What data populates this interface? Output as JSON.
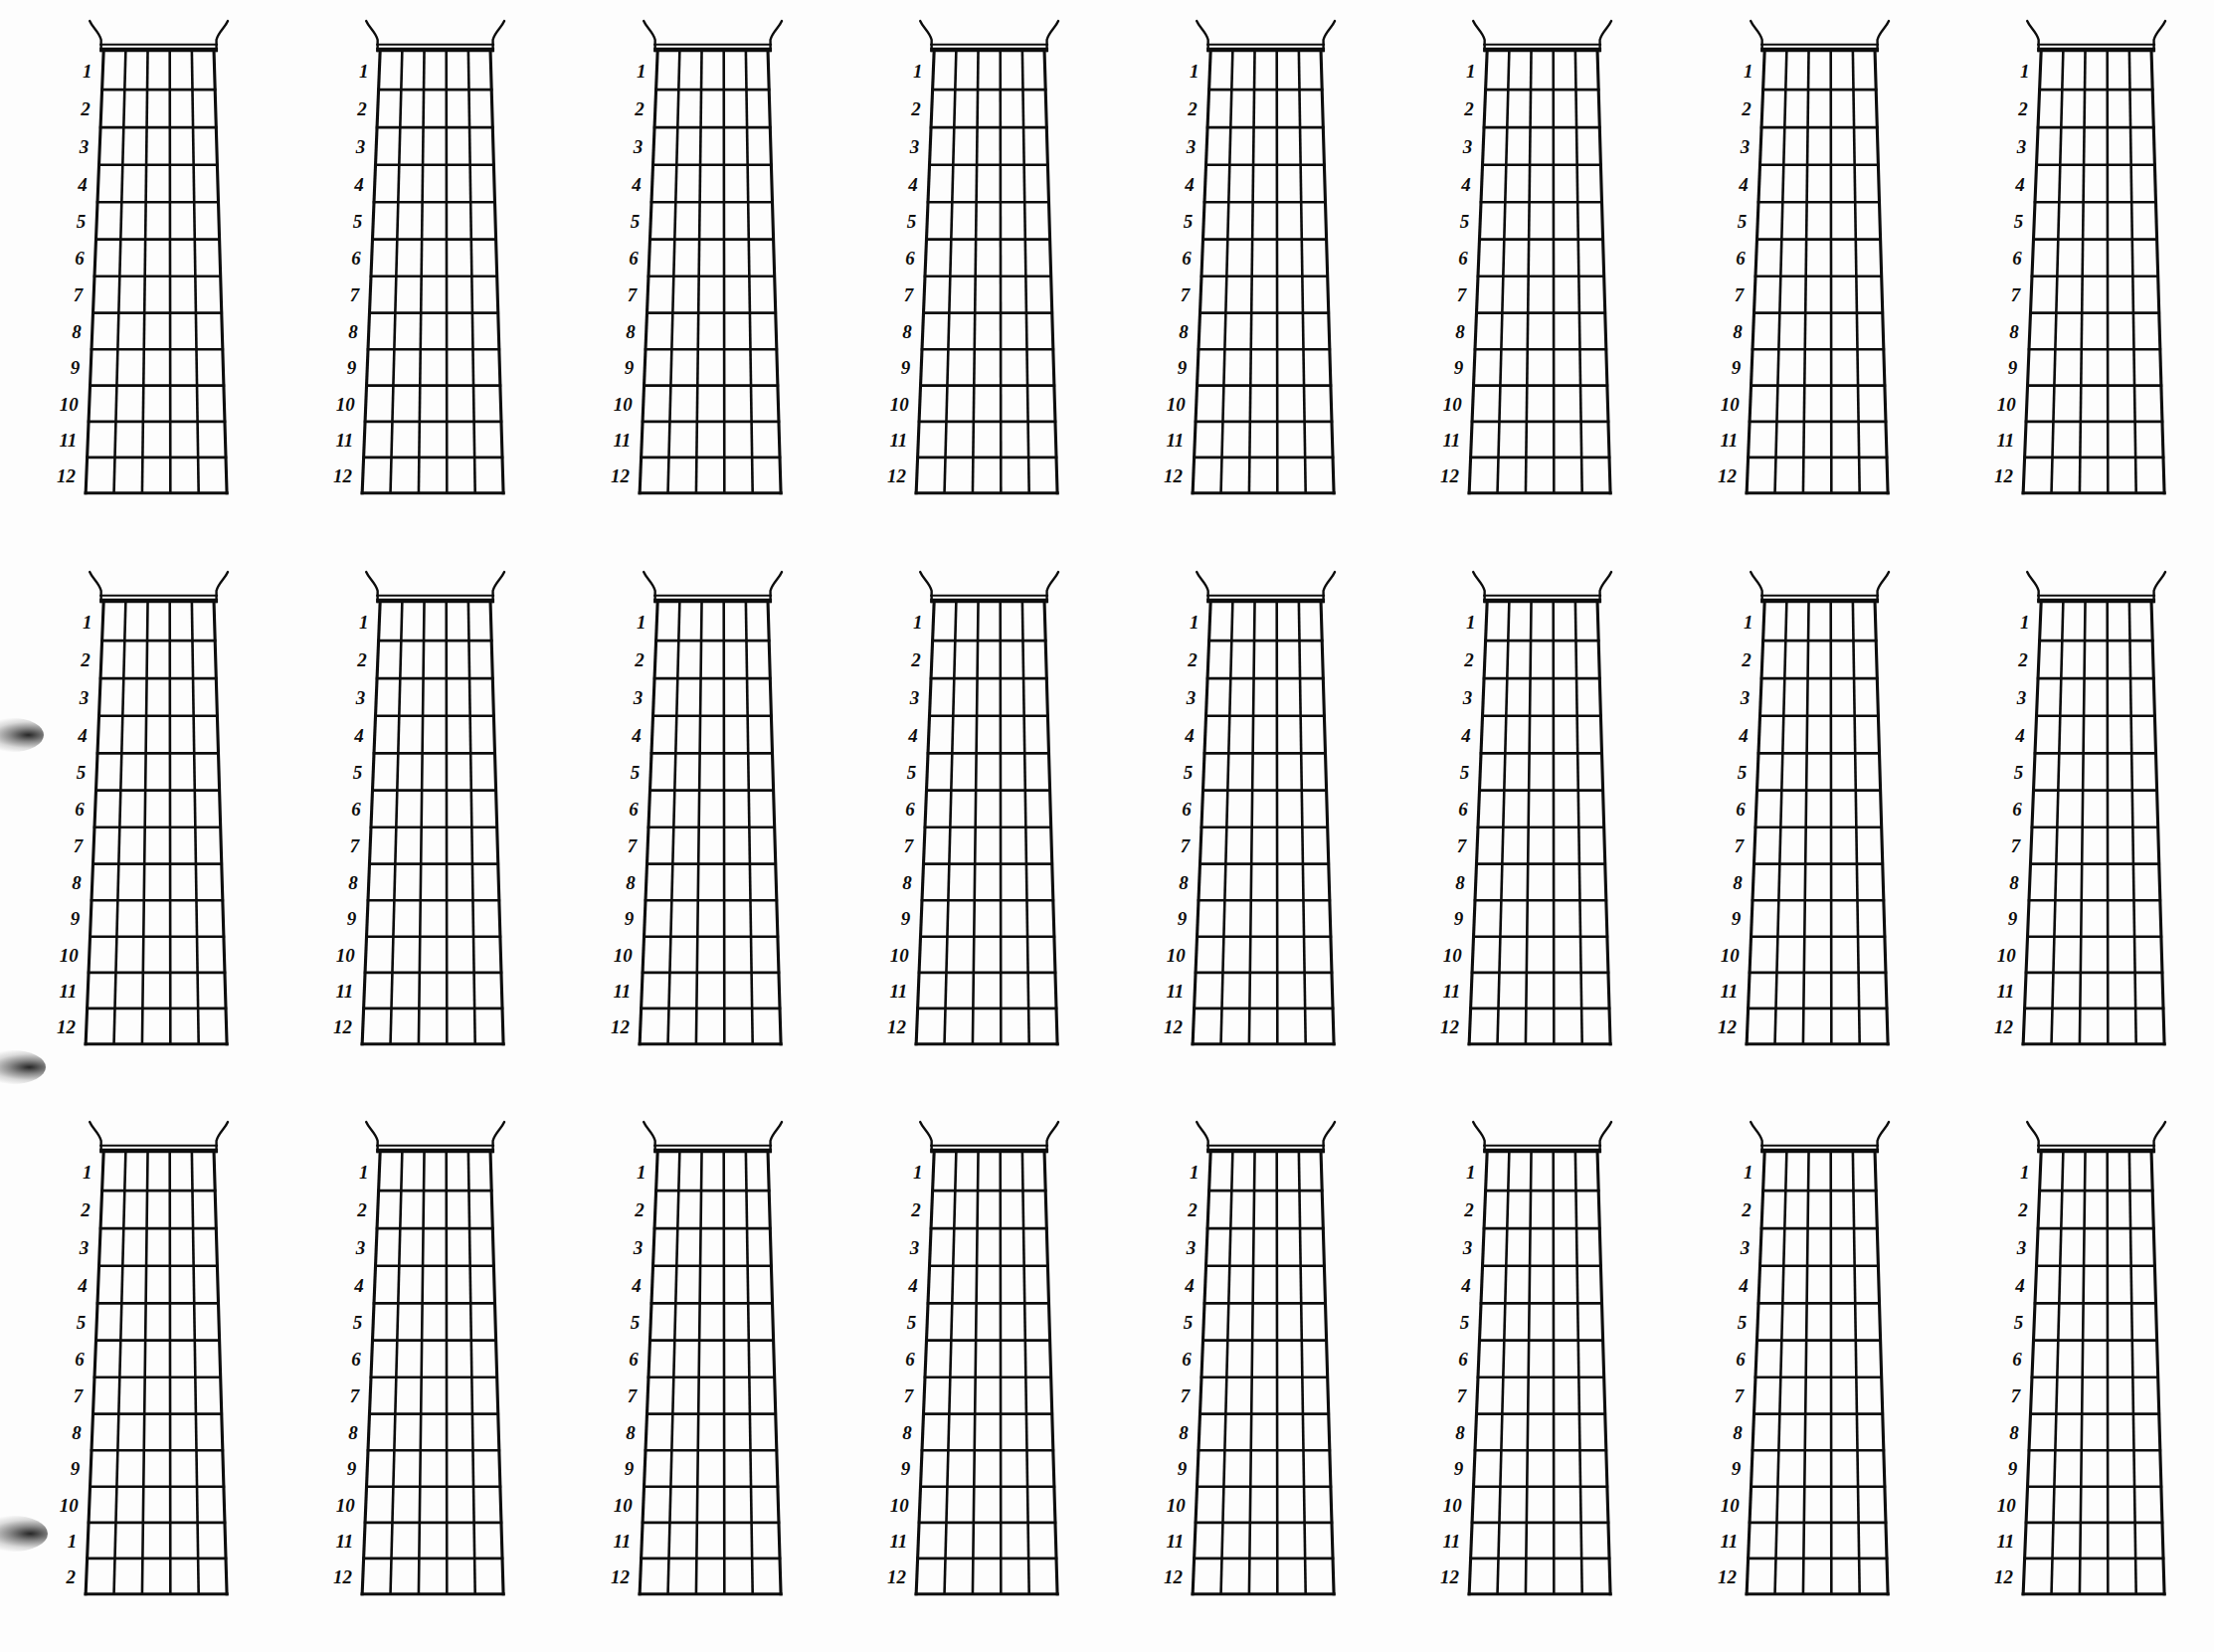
{
  "page": {
    "background_color": "#fdfdfd",
    "ink_color": "#0d0d0d",
    "rows": 3,
    "columns": 8,
    "diagram_count": 24
  },
  "diagram": {
    "instrument": "guitar",
    "string_count": 6,
    "fret_count": 12,
    "nut_label": "nut",
    "fret_numbers": [
      "1",
      "2",
      "3",
      "4",
      "5",
      "6",
      "7",
      "8",
      "9",
      "10",
      "11",
      "12"
    ]
  },
  "diagrams": [
    {
      "id": "diagram-r1c1",
      "row": 1,
      "col": 1,
      "fret_numbers": [
        "1",
        "2",
        "3",
        "4",
        "5",
        "6",
        "7",
        "8",
        "9",
        "10",
        "11",
        "12"
      ]
    },
    {
      "id": "diagram-r1c2",
      "row": 1,
      "col": 2,
      "fret_numbers": [
        "1",
        "2",
        "3",
        "4",
        "5",
        "6",
        "7",
        "8",
        "9",
        "10",
        "11",
        "12"
      ]
    },
    {
      "id": "diagram-r1c3",
      "row": 1,
      "col": 3,
      "fret_numbers": [
        "1",
        "2",
        "3",
        "4",
        "5",
        "6",
        "7",
        "8",
        "9",
        "10",
        "11",
        "12"
      ]
    },
    {
      "id": "diagram-r1c4",
      "row": 1,
      "col": 4,
      "fret_numbers": [
        "1",
        "2",
        "3",
        "4",
        "5",
        "6",
        "7",
        "8",
        "9",
        "10",
        "11",
        "12"
      ]
    },
    {
      "id": "diagram-r1c5",
      "row": 1,
      "col": 5,
      "fret_numbers": [
        "1",
        "2",
        "3",
        "4",
        "5",
        "6",
        "7",
        "8",
        "9",
        "10",
        "11",
        "12"
      ]
    },
    {
      "id": "diagram-r1c6",
      "row": 1,
      "col": 6,
      "fret_numbers": [
        "1",
        "2",
        "3",
        "4",
        "5",
        "6",
        "7",
        "8",
        "9",
        "10",
        "11",
        "12"
      ]
    },
    {
      "id": "diagram-r1c7",
      "row": 1,
      "col": 7,
      "fret_numbers": [
        "1",
        "2",
        "3",
        "4",
        "5",
        "6",
        "7",
        "8",
        "9",
        "10",
        "11",
        "12"
      ]
    },
    {
      "id": "diagram-r1c8",
      "row": 1,
      "col": 8,
      "fret_numbers": [
        "1",
        "2",
        "3",
        "4",
        "5",
        "6",
        "7",
        "8",
        "9",
        "10",
        "11",
        "12"
      ]
    },
    {
      "id": "diagram-r2c1",
      "row": 2,
      "col": 1,
      "fret_numbers": [
        "1",
        "2",
        "3",
        "4",
        "5",
        "6",
        "7",
        "8",
        "9",
        "10",
        "11",
        "12"
      ]
    },
    {
      "id": "diagram-r2c2",
      "row": 2,
      "col": 2,
      "fret_numbers": [
        "1",
        "2",
        "3",
        "4",
        "5",
        "6",
        "7",
        "8",
        "9",
        "10",
        "11",
        "12"
      ]
    },
    {
      "id": "diagram-r2c3",
      "row": 2,
      "col": 3,
      "fret_numbers": [
        "1",
        "2",
        "3",
        "4",
        "5",
        "6",
        "7",
        "8",
        "9",
        "10",
        "11",
        "12"
      ]
    },
    {
      "id": "diagram-r2c4",
      "row": 2,
      "col": 4,
      "fret_numbers": [
        "1",
        "2",
        "3",
        "4",
        "5",
        "6",
        "7",
        "8",
        "9",
        "10",
        "11",
        "12"
      ]
    },
    {
      "id": "diagram-r2c5",
      "row": 2,
      "col": 5,
      "fret_numbers": [
        "1",
        "2",
        "3",
        "4",
        "5",
        "6",
        "7",
        "8",
        "9",
        "10",
        "11",
        "12"
      ]
    },
    {
      "id": "diagram-r2c6",
      "row": 2,
      "col": 6,
      "fret_numbers": [
        "1",
        "2",
        "3",
        "4",
        "5",
        "6",
        "7",
        "8",
        "9",
        "10",
        "11",
        "12"
      ]
    },
    {
      "id": "diagram-r2c7",
      "row": 2,
      "col": 7,
      "fret_numbers": [
        "1",
        "2",
        "3",
        "4",
        "5",
        "6",
        "7",
        "8",
        "9",
        "10",
        "11",
        "12"
      ]
    },
    {
      "id": "diagram-r2c8",
      "row": 2,
      "col": 8,
      "fret_numbers": [
        "1",
        "2",
        "3",
        "4",
        "5",
        "6",
        "7",
        "8",
        "9",
        "10",
        "11",
        "12"
      ]
    },
    {
      "id": "diagram-r3c1",
      "row": 3,
      "col": 1,
      "fret_numbers": [
        "1",
        "2",
        "3",
        "4",
        "5",
        "6",
        "7",
        "8",
        "9",
        "10",
        "1",
        "2"
      ]
    },
    {
      "id": "diagram-r3c2",
      "row": 3,
      "col": 2,
      "fret_numbers": [
        "1",
        "2",
        "3",
        "4",
        "5",
        "6",
        "7",
        "8",
        "9",
        "10",
        "11",
        "12"
      ]
    },
    {
      "id": "diagram-r3c3",
      "row": 3,
      "col": 3,
      "fret_numbers": [
        "1",
        "2",
        "3",
        "4",
        "5",
        "6",
        "7",
        "8",
        "9",
        "10",
        "11",
        "12"
      ]
    },
    {
      "id": "diagram-r3c4",
      "row": 3,
      "col": 4,
      "fret_numbers": [
        "1",
        "2",
        "3",
        "4",
        "5",
        "6",
        "7",
        "8",
        "9",
        "10",
        "11",
        "12"
      ]
    },
    {
      "id": "diagram-r3c5",
      "row": 3,
      "col": 5,
      "fret_numbers": [
        "1",
        "2",
        "3",
        "4",
        "5",
        "6",
        "7",
        "8",
        "9",
        "10",
        "11",
        "12"
      ]
    },
    {
      "id": "diagram-r3c6",
      "row": 3,
      "col": 6,
      "fret_numbers": [
        "1",
        "2",
        "3",
        "4",
        "5",
        "6",
        "7",
        "8",
        "9",
        "10",
        "11",
        "12"
      ]
    },
    {
      "id": "diagram-r3c7",
      "row": 3,
      "col": 7,
      "fret_numbers": [
        "1",
        "2",
        "3",
        "4",
        "5",
        "6",
        "7",
        "8",
        "9",
        "10",
        "11",
        "12"
      ]
    },
    {
      "id": "diagram-r3c8",
      "row": 3,
      "col": 8,
      "fret_numbers": [
        "1",
        "2",
        "3",
        "4",
        "5",
        "6",
        "7",
        "8",
        "9",
        "10",
        "11",
        "12"
      ]
    }
  ],
  "artifacts": {
    "smudges": [
      {
        "name": "scan-smudge-left-middle",
        "x": -18,
        "y": 722,
        "w": 62,
        "h": 34
      },
      {
        "name": "scan-smudge-left-bottom",
        "x": -20,
        "y": 1056,
        "w": 66,
        "h": 34
      },
      {
        "name": "scan-smudge-left-lower",
        "x": -22,
        "y": 1524,
        "w": 70,
        "h": 36
      }
    ]
  }
}
